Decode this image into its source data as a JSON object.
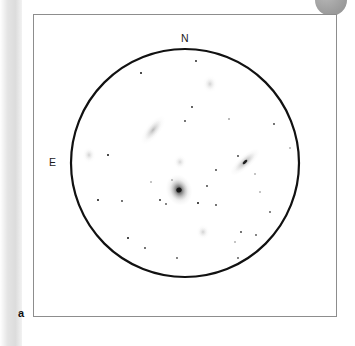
{
  "figure": {
    "panel_label": "a",
    "caption_kind": "eyepiece-field-sketch",
    "frame": {
      "x": 33,
      "y": 14,
      "width": 304,
      "height": 303
    },
    "field_circle": {
      "cx": 185,
      "cy": 163,
      "r": 114,
      "stroke": "#111111",
      "stroke_width": 2.2
    },
    "background_color": "#ffffff",
    "ink_color": "#111111"
  },
  "compass": {
    "north_label": "N",
    "east_label": "E"
  },
  "chart_data": {
    "type": "scatter",
    "title": "",
    "xlabel": "",
    "ylabel": "",
    "grid": false,
    "legend": "none",
    "stars": [
      {
        "x": 196,
        "y": 61,
        "r": 0.9,
        "mag": 12.0
      },
      {
        "x": 141,
        "y": 73,
        "r": 1.0,
        "mag": 11.8
      },
      {
        "x": 192,
        "y": 107,
        "r": 0.9,
        "mag": 12.1
      },
      {
        "x": 185,
        "y": 121,
        "r": 0.9,
        "mag": 12.2
      },
      {
        "x": 229,
        "y": 119,
        "r": 0.8,
        "mag": 12.4
      },
      {
        "x": 274,
        "y": 124,
        "r": 0.9,
        "mag": 12.2
      },
      {
        "x": 290,
        "y": 148,
        "r": 0.8,
        "mag": 12.5
      },
      {
        "x": 108,
        "y": 155,
        "r": 1.0,
        "mag": 11.9
      },
      {
        "x": 238,
        "y": 156,
        "r": 0.9,
        "mag": 12.2
      },
      {
        "x": 216,
        "y": 170,
        "r": 0.9,
        "mag": 12.2
      },
      {
        "x": 207,
        "y": 186,
        "r": 0.9,
        "mag": 12.2
      },
      {
        "x": 160,
        "y": 200,
        "r": 0.9,
        "mag": 12.1
      },
      {
        "x": 198,
        "y": 203,
        "r": 1.0,
        "mag": 11.9
      },
      {
        "x": 216,
        "y": 205,
        "r": 0.9,
        "mag": 12.2
      },
      {
        "x": 98,
        "y": 200,
        "r": 1.0,
        "mag": 11.9
      },
      {
        "x": 122,
        "y": 201,
        "r": 0.9,
        "mag": 12.2
      },
      {
        "x": 166,
        "y": 204,
        "r": 0.9,
        "mag": 12.3
      },
      {
        "x": 270,
        "y": 212,
        "r": 0.9,
        "mag": 12.3
      },
      {
        "x": 241,
        "y": 232,
        "r": 0.9,
        "mag": 12.2
      },
      {
        "x": 256,
        "y": 235,
        "r": 0.9,
        "mag": 12.3
      },
      {
        "x": 235,
        "y": 242,
        "r": 0.8,
        "mag": 12.5
      },
      {
        "x": 128,
        "y": 238,
        "r": 1.0,
        "mag": 12.0
      },
      {
        "x": 145,
        "y": 248,
        "r": 0.9,
        "mag": 12.2
      },
      {
        "x": 177,
        "y": 258,
        "r": 0.9,
        "mag": 12.3
      },
      {
        "x": 238,
        "y": 258,
        "r": 0.9,
        "mag": 12.3
      },
      {
        "x": 260,
        "y": 192,
        "r": 0.8,
        "mag": 12.5
      },
      {
        "x": 255,
        "y": 174,
        "r": 0.8,
        "mag": 12.5
      },
      {
        "x": 172,
        "y": 180,
        "r": 0.8,
        "mag": 12.5
      },
      {
        "x": 151,
        "y": 182,
        "r": 0.8,
        "mag": 12.6
      }
    ],
    "nebulous_objects": [
      {
        "name": "central-bright-galaxy",
        "x": 179,
        "y": 190,
        "rx": 9,
        "ry": 11,
        "angle": -20,
        "brightness": 0.92,
        "has_stellar_core": true
      },
      {
        "name": "elongated-galaxy-nw",
        "x": 153,
        "y": 130,
        "rx": 5,
        "ry": 12,
        "angle": 38,
        "brightness": 0.42,
        "has_stellar_core": false
      },
      {
        "name": "edge-on-galaxy-e",
        "x": 245,
        "y": 162,
        "rx": 4.5,
        "ry": 13,
        "angle": 48,
        "brightness": 0.55,
        "has_stellar_core": true
      },
      {
        "name": "faint-patch-n",
        "x": 210,
        "y": 84,
        "rx": 5,
        "ry": 6,
        "angle": 0,
        "brightness": 0.26,
        "has_stellar_core": false
      },
      {
        "name": "faint-patch-center",
        "x": 180,
        "y": 162,
        "rx": 4.5,
        "ry": 5,
        "angle": 0,
        "brightness": 0.24,
        "has_stellar_core": false
      },
      {
        "name": "faint-patch-s",
        "x": 203,
        "y": 232,
        "rx": 4.5,
        "ry": 5,
        "angle": 0,
        "brightness": 0.26,
        "has_stellar_core": false
      },
      {
        "name": "faint-patch-e-edge",
        "x": 89,
        "y": 155,
        "rx": 4.5,
        "ry": 5.5,
        "angle": 0,
        "brightness": 0.26,
        "has_stellar_core": false
      }
    ]
  }
}
